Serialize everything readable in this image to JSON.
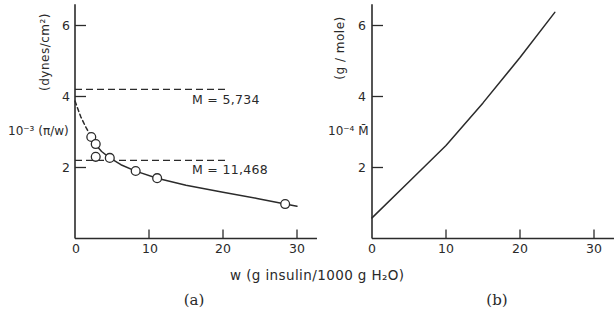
{
  "figure": {
    "xlabel": "w (g insulin/1000 g H₂O)",
    "panel_a": {
      "tag": "(a)",
      "ylabel_main": "10⁻³ (π/w)",
      "ylabel_units": "(dynes/cm²)",
      "yticks": [
        "6",
        "4",
        "2"
      ],
      "xticks": [
        "0",
        "10",
        "20",
        "30"
      ],
      "ref_labels": [
        "M = 5,734",
        "M = 11,468"
      ]
    },
    "panel_b": {
      "tag": "(b)",
      "ylabel_main": "10⁻⁴ M̄",
      "ylabel_units": "(g / mole)",
      "yticks": [
        "6",
        "4",
        "2"
      ],
      "xticks": [
        "0",
        "10",
        "20",
        "30"
      ]
    }
  },
  "chart_data": [
    {
      "panel": "(a)",
      "type": "scatter",
      "title": "",
      "xlabel": "w (g insulin/1000 g H₂O)",
      "ylabel": "10⁻³ (π/w) (dynes/cm²)",
      "xlim": [
        0,
        32.7
      ],
      "ylim": [
        0,
        6.6
      ],
      "xticks": [
        0,
        10,
        20,
        30
      ],
      "yticks": [
        2,
        4,
        6
      ],
      "grid": false,
      "series": [
        {
          "name": "measured",
          "type": "scatter",
          "points": [
            [
              2.2,
              2.86
            ],
            [
              2.8,
              2.66
            ],
            [
              2.8,
              2.3
            ],
            [
              4.7,
              2.27
            ],
            [
              8.2,
              1.9
            ],
            [
              11.1,
              1.7
            ],
            [
              28.4,
              0.97
            ]
          ]
        },
        {
          "name": "fitted curve",
          "type": "line",
          "dashed": false,
          "points": [
            [
              2.2,
              2.86
            ],
            [
              2.8,
              2.64
            ],
            [
              3.6,
              2.45
            ],
            [
              4.7,
              2.27
            ],
            [
              6.2,
              2.08
            ],
            [
              8.2,
              1.9
            ],
            [
              11.1,
              1.7
            ],
            [
              15,
              1.5
            ],
            [
              20,
              1.3
            ],
            [
              24.6,
              1.13
            ],
            [
              28.4,
              0.97
            ],
            [
              30,
              0.91
            ]
          ]
        },
        {
          "name": "extrapolation",
          "type": "line",
          "dashed": true,
          "points": [
            [
              0,
              3.87
            ],
            [
              0.8,
              3.42
            ],
            [
              1.5,
              3.12
            ],
            [
              2.2,
              2.86
            ]
          ]
        }
      ],
      "reference_lines": [
        {
          "y": 4.2,
          "x_start": 0,
          "x_end": 20.3,
          "label": "M = 5,734"
        },
        {
          "y": 2.2,
          "x_start": 0,
          "x_end": 20.8,
          "label": "M = 11,468"
        }
      ]
    },
    {
      "panel": "(b)",
      "type": "line",
      "title": "",
      "xlabel": "w (g insulin/1000 g H₂O)",
      "ylabel": "10⁻⁴ M̄ (g / mole)",
      "xlim": [
        0,
        32.7
      ],
      "ylim": [
        0,
        6.6
      ],
      "xticks": [
        0,
        10,
        20,
        30
      ],
      "yticks": [
        2,
        4,
        6
      ],
      "grid": false,
      "series": [
        {
          "name": "weight-average molecular weight",
          "type": "line",
          "dashed": false,
          "points": [
            [
              0,
              0.58
            ],
            [
              5,
              1.6
            ],
            [
              10,
              2.62
            ],
            [
              15,
              3.82
            ],
            [
              20,
              5.1
            ],
            [
              24.7,
              6.37
            ]
          ]
        }
      ]
    }
  ]
}
